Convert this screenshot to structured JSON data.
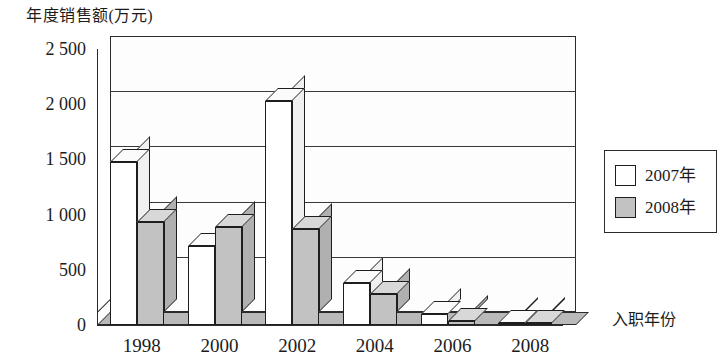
{
  "chart_data": {
    "type": "bar",
    "title": "年度销售额(万元)",
    "xlabel": "入职年份",
    "ylabel": "年度销售额(万元)",
    "categories": [
      "1998",
      "2000",
      "2002",
      "2004",
      "2006",
      "2008"
    ],
    "series": [
      {
        "name": "2007年",
        "values": [
          1480,
          720,
          2030,
          380,
          100,
          20
        ],
        "color": "#ffffff"
      },
      {
        "name": "2008年",
        "values": [
          930,
          890,
          870,
          280,
          40,
          20
        ],
        "color": "#c2c2c2"
      }
    ],
    "ylim": [
      0,
      2500
    ],
    "y_ticks": [
      0,
      500,
      1000,
      1500,
      2000,
      2500
    ],
    "y_tick_labels": [
      "0",
      "500",
      "1 000",
      "1 500",
      "2 000",
      "2 500"
    ],
    "grid": true,
    "legend_position": "right",
    "style": "3d-column"
  },
  "legend": {
    "entries": [
      {
        "label": "2007年"
      },
      {
        "label": "2008年"
      }
    ]
  },
  "axis_titles": {
    "y": "年度销售额(万元)",
    "x": "入职年份"
  },
  "colors": {
    "series_a": "#ffffff",
    "series_b": "#c2c2c2",
    "axis": "#2b2b2b",
    "grid": "#3a3a3a",
    "floor": "#b9b9b9"
  }
}
